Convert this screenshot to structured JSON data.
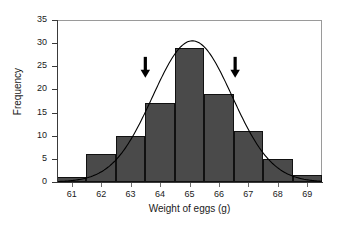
{
  "chart_data": {
    "type": "bar",
    "title": "",
    "subtitle": "",
    "xlabel": "Weight of eggs (g)",
    "ylabel": "Frequency",
    "categories": [
      "61",
      "62",
      "63",
      "64",
      "65",
      "66",
      "67",
      "68",
      "69"
    ],
    "values": [
      1,
      6,
      10,
      17,
      29,
      19,
      11,
      5,
      1.5
    ],
    "xlim": [
      60.5,
      69.5
    ],
    "ylim": [
      0,
      35
    ],
    "yticks": [
      0,
      5,
      10,
      15,
      20,
      25,
      30,
      35
    ],
    "ytick_labels": [
      "0",
      "5",
      "10",
      "15",
      "20",
      "25",
      "30",
      "35"
    ],
    "xtick_labels": [
      "61",
      "62",
      "63",
      "64",
      "65",
      "66",
      "67",
      "68",
      "69"
    ],
    "grid": false,
    "legend": "none",
    "bar_color": "#4a4a4a",
    "bar_edge_color": "#111111",
    "curve_color": "#000000",
    "frame_color": "#9a9a9a",
    "background": "#ffffff",
    "overlay": {
      "type": "line",
      "name": "normal-distribution-curve",
      "peak_x": 65.1,
      "peak_y": 30.5,
      "mean": 65.1,
      "sd": 1.35
    },
    "annotations": [
      {
        "name": "left-arrow-marker",
        "symbol": "down-arrow",
        "x": 63.5,
        "y": 22.5,
        "color": "#000000"
      },
      {
        "name": "right-arrow-marker",
        "symbol": "down-arrow",
        "x": 66.55,
        "y": 22.5,
        "color": "#000000"
      }
    ]
  }
}
